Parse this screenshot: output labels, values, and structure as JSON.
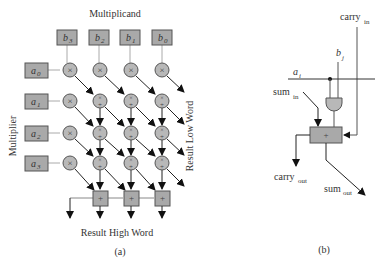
{
  "figure_a": {
    "title": "Multiplicand",
    "left_label": "Multiplier",
    "right_label": "Result Low Word",
    "bottom_label": "Result High Word",
    "caption": "(a)",
    "multiplicand_bits": [
      {
        "base": "b",
        "sub": "3"
      },
      {
        "base": "b",
        "sub": "2"
      },
      {
        "base": "b",
        "sub": "1"
      },
      {
        "base": "b",
        "sub": "0"
      }
    ],
    "multiplier_bits": [
      {
        "base": "a",
        "sub": "0"
      },
      {
        "base": "a",
        "sub": "1"
      },
      {
        "base": "a",
        "sub": "2"
      },
      {
        "base": "a",
        "sub": "3"
      }
    ],
    "mult_symbol": "×",
    "add_symbol": "+"
  },
  "figure_b": {
    "caption": "(b)",
    "carry_in": {
      "base": "carry",
      "sub": "in"
    },
    "b_j": {
      "base": "b",
      "sub": "j"
    },
    "a_i": {
      "base": "a",
      "sub": "i"
    },
    "sum_in": {
      "base": "sum",
      "sub": "in"
    },
    "carry_out": {
      "base": "carry",
      "sub": "out"
    },
    "sum_out": {
      "base": "sum",
      "sub": "out"
    },
    "add_symbol": "+"
  },
  "colors": {
    "cell_fill": "#b8b8b8",
    "box_fill": "#a9a9a9",
    "stroke": "#555555",
    "arrow": "#222222",
    "wire": "#aaaaaa"
  }
}
